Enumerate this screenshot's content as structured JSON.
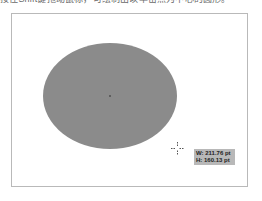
{
  "caption": {
    "text": "按住Shift键拖动鼠标，可绘制出以单击点为中心的圆形。"
  },
  "canvas": {
    "border_color": "#b9b9b9",
    "background": "#ffffff"
  },
  "shape": {
    "type": "ellipse",
    "fill": "#8b8b8b"
  },
  "cursor": {
    "icon": "crosshair-icon"
  },
  "tooltip": {
    "width_label": "W: 211.76 pt",
    "height_label": "H: 160.13 pt"
  }
}
